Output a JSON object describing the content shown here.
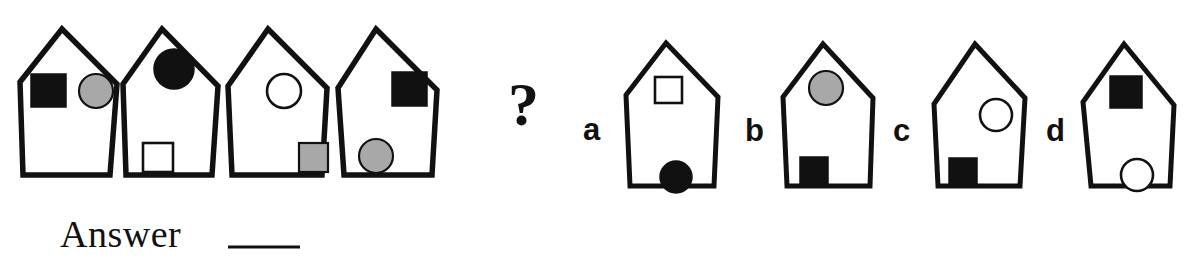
{
  "puzzle": {
    "type": "visual-analogy-matrix",
    "prompt_symbol": "?",
    "answer_label": "Answer",
    "answer_blank": "____",
    "colors": {
      "stroke": "#111111",
      "black_fill": "#111111",
      "gray_fill": "#a8a8a8",
      "white_fill": "#ffffff",
      "background": "#ffffff"
    },
    "sequence": [
      {
        "id": "seq-1",
        "shape": "pentagon-house",
        "marks": [
          {
            "figure": "square",
            "fill": "black",
            "position": "upper-left"
          },
          {
            "figure": "circle",
            "fill": "gray",
            "position": "upper-right"
          }
        ]
      },
      {
        "id": "seq-2",
        "shape": "pentagon-house",
        "marks": [
          {
            "figure": "circle",
            "fill": "black",
            "position": "top-center"
          },
          {
            "figure": "square",
            "fill": "white",
            "position": "bottom-left"
          }
        ]
      },
      {
        "id": "seq-3",
        "shape": "pentagon-house",
        "marks": [
          {
            "figure": "circle",
            "fill": "white",
            "position": "upper-left"
          },
          {
            "figure": "square",
            "fill": "gray",
            "position": "bottom-right"
          }
        ]
      },
      {
        "id": "seq-4",
        "shape": "pentagon-house",
        "marks": [
          {
            "figure": "square",
            "fill": "black",
            "position": "upper-right"
          },
          {
            "figure": "circle",
            "fill": "gray",
            "position": "bottom-left"
          }
        ]
      }
    ],
    "options": [
      {
        "id": "opt-a",
        "letter": "a",
        "shape": "pentagon-house",
        "marks": [
          {
            "figure": "square",
            "fill": "white",
            "position": "top-center"
          },
          {
            "figure": "circle",
            "fill": "black",
            "position": "bottom-center"
          }
        ]
      },
      {
        "id": "opt-b",
        "letter": "b",
        "shape": "pentagon-house",
        "marks": [
          {
            "figure": "circle",
            "fill": "gray",
            "position": "top-center"
          },
          {
            "figure": "square",
            "fill": "black",
            "position": "bottom-left"
          }
        ]
      },
      {
        "id": "opt-c",
        "letter": "c",
        "shape": "pentagon-house",
        "marks": [
          {
            "figure": "circle",
            "fill": "white",
            "position": "upper-right"
          },
          {
            "figure": "square",
            "fill": "black",
            "position": "bottom-left"
          }
        ]
      },
      {
        "id": "opt-d",
        "letter": "d",
        "shape": "pentagon-house",
        "marks": [
          {
            "figure": "square",
            "fill": "black",
            "position": "top-center"
          },
          {
            "figure": "circle",
            "fill": "white",
            "position": "bottom-right"
          }
        ]
      }
    ]
  }
}
